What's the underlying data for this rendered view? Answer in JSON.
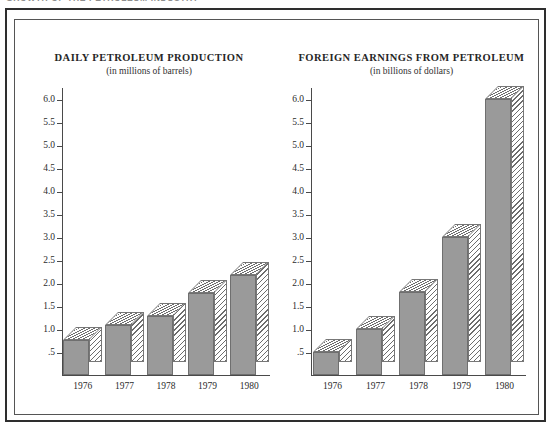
{
  "running_head": "GROWTH OF THE PETROLEUM INDUSTRY",
  "figure": {
    "frame_color": "#2e2e2e",
    "bar_fill_color": "#9a9a9a",
    "bar_hatch_color": "#6d6d6d"
  },
  "charts": [
    {
      "id": "daily-petroleum-production",
      "title": "DAILY PETROLEUM PRODUCTION",
      "subtitle": "(in millions of barrels)"
    },
    {
      "id": "foreign-earnings-from-petroleum",
      "title": "FOREIGN EARNINGS FROM PETROLEUM",
      "subtitle": "(in billions of dollars)"
    }
  ],
  "chart_data": [
    {
      "type": "bar",
      "title": "DAILY PETROLEUM PRODUCTION",
      "subtitle": "(in millions of barrels)",
      "xlabel": "",
      "ylabel": "",
      "categories": [
        "1976",
        "1977",
        "1978",
        "1979",
        "1980"
      ],
      "values": [
        0.77,
        1.08,
        1.27,
        1.77,
        2.18
      ],
      "ylim": [
        0,
        6.25
      ],
      "yticks": [
        0.5,
        1.0,
        1.5,
        2.0,
        2.5,
        3.0,
        3.5,
        4.0,
        4.5,
        5.0,
        5.5,
        6.0
      ],
      "ytick_labels": [
        ".5",
        "1.0",
        "1.5",
        "2.0",
        "2.5",
        "3.0",
        "3.5",
        "4.0",
        "4.5",
        "5.0",
        "5.5",
        "6.0"
      ],
      "grid": false,
      "legend": "none",
      "style": "3d-blocks-with-hatched-top-and-side"
    },
    {
      "type": "bar",
      "title": "FOREIGN EARNINGS FROM PETROLEUM",
      "subtitle": "(in billions of dollars)",
      "xlabel": "",
      "ylabel": "",
      "categories": [
        "1976",
        "1977",
        "1978",
        "1979",
        "1980"
      ],
      "values": [
        0.5,
        1.0,
        1.8,
        3.0,
        6.0
      ],
      "ylim": [
        0,
        6.25
      ],
      "yticks": [
        0.5,
        1.0,
        1.5,
        2.0,
        2.5,
        3.0,
        3.5,
        4.0,
        4.5,
        5.0,
        5.5,
        6.0
      ],
      "ytick_labels": [
        ".5",
        "1.0",
        "1.5",
        "2.0",
        "2.5",
        "3.0",
        "3.5",
        "4.0",
        "4.5",
        "5.0",
        "5.5",
        "6.0"
      ],
      "grid": false,
      "legend": "none",
      "style": "3d-blocks-with-hatched-top-and-side"
    }
  ]
}
